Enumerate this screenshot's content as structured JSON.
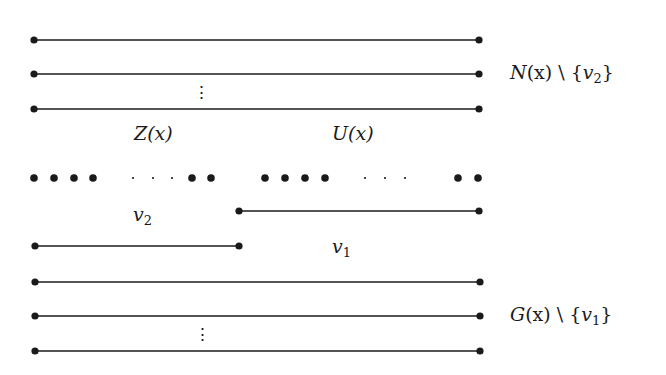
{
  "diagram": {
    "type": "graph-structure-figure",
    "colors": {
      "ink": "#1a1a1a",
      "background": "#ffffff"
    },
    "labels": {
      "top_set": {
        "name": "N",
        "arg": "(x)",
        "minus": " \\ ",
        "set_open": "{",
        "var": "v",
        "sub": "2",
        "set_close": "}"
      },
      "bottom_set": {
        "name": "G",
        "arg": "(x)",
        "minus": " \\ ",
        "set_open": "{",
        "var": "v",
        "sub": "1",
        "set_close": "}"
      },
      "z_region": "Z(x)",
      "u_region": "U(x)",
      "v2": {
        "var": "v",
        "sub": "2"
      },
      "v1": {
        "var": "v",
        "sub": "1"
      },
      "vdots": "⋮"
    },
    "lines": [
      {
        "id": "n1",
        "y": 40,
        "x1": 34,
        "x2": 479
      },
      {
        "id": "n2",
        "y": 74,
        "x1": 34,
        "x2": 479
      },
      {
        "id": "n3",
        "y": 109,
        "x1": 34,
        "x2": 479
      },
      {
        "id": "v1-edge",
        "y": 211,
        "x1": 239,
        "x2": 479
      },
      {
        "id": "v2-edge",
        "y": 246,
        "x1": 35,
        "x2": 239
      },
      {
        "id": "g1",
        "y": 282,
        "x1": 35,
        "x2": 480
      },
      {
        "id": "g2",
        "y": 316,
        "x1": 35,
        "x2": 480
      },
      {
        "id": "g3",
        "y": 351,
        "x1": 35,
        "x2": 480
      }
    ],
    "vertex_row": {
      "y": 178,
      "large_dots_x": [
        34,
        54,
        74,
        93,
        192,
        211,
        265,
        285,
        305,
        325,
        458,
        478
      ],
      "small_dots_x": [
        133,
        153,
        172,
        365,
        385,
        405
      ]
    }
  }
}
